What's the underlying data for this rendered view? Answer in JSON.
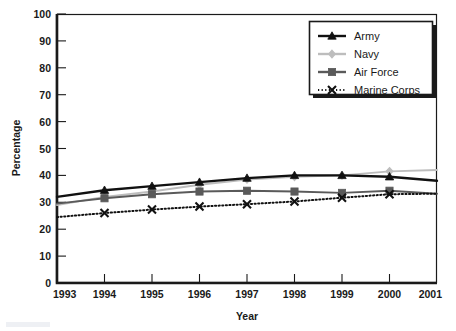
{
  "chart_data": {
    "type": "line",
    "title": "",
    "xlabel": "Year",
    "ylabel": "Percentage",
    "categories": [
      "1993",
      "1994",
      "1995",
      "1996",
      "1997",
      "1998",
      "1999",
      "2000",
      "2001"
    ],
    "x": [
      1993,
      1994,
      1995,
      1996,
      1997,
      1998,
      1999,
      2000,
      2001
    ],
    "xlim": [
      1993,
      2001
    ],
    "ylim": [
      0,
      100
    ],
    "yticks": [
      0,
      10,
      20,
      30,
      40,
      50,
      60,
      70,
      80,
      90,
      100
    ],
    "ytick_labels": [
      "0",
      "10",
      "20",
      "30",
      "40",
      "50",
      "60",
      "70",
      "80",
      "90",
      "100"
    ],
    "grid": false,
    "legend_position": "top-right",
    "series": [
      {
        "name": "Army",
        "values": [
          32,
          34.5,
          36,
          37.5,
          39,
          40,
          40,
          39.5,
          38
        ],
        "color": "#111111",
        "marker": "triangle",
        "line_style": "solid"
      },
      {
        "name": "Navy",
        "values": [
          29,
          32,
          34,
          36.5,
          38.5,
          39.5,
          40,
          41.5,
          42
        ],
        "color": "#bdbdbd",
        "marker": "diamond",
        "line_style": "solid"
      },
      {
        "name": "Air Force",
        "values": [
          29.5,
          31.5,
          33,
          34,
          34.3,
          34,
          33.5,
          34.3,
          33.2
        ],
        "color": "#5a5a5a",
        "marker": "square",
        "line_style": "solid"
      },
      {
        "name": "Marine Corps",
        "values": [
          24.5,
          26,
          27.3,
          28.4,
          29.3,
          30.3,
          31.7,
          33,
          33.2
        ],
        "color": "#111111",
        "marker": "x",
        "line_style": "dotted"
      }
    ]
  },
  "legend": {
    "entries": [
      {
        "label": "Army"
      },
      {
        "label": "Navy"
      },
      {
        "label": "Air Force"
      },
      {
        "label": "Marine Corps"
      }
    ]
  },
  "colors": {
    "army": "#111111",
    "navy": "#bdbdbd",
    "air_force": "#5a5a5a",
    "marine_corps": "#111111",
    "axis": "#1a1a1a",
    "background": "#ffffff"
  }
}
